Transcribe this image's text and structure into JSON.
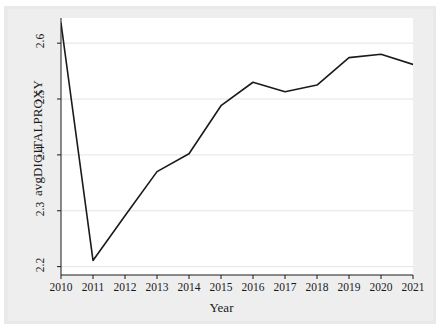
{
  "chart_data": {
    "type": "line",
    "title": "",
    "xlabel": "Year",
    "ylabel": "avgDIGITALPROXY",
    "x": [
      2010,
      2011,
      2012,
      2013,
      2014,
      2015,
      2016,
      2017,
      2018,
      2019,
      2020,
      2021
    ],
    "categories": [
      "2010",
      "2011",
      "2012",
      "2013",
      "2014",
      "2015",
      "2016",
      "2017",
      "2018",
      "2019",
      "2020",
      "2021"
    ],
    "values": [
      2.636,
      2.211,
      2.291,
      2.37,
      2.402,
      2.488,
      2.53,
      2.513,
      2.525,
      2.574,
      2.58,
      2.562
    ],
    "series": [
      {
        "name": "avgDIGITALPROXY",
        "values": [
          2.636,
          2.211,
          2.291,
          2.37,
          2.402,
          2.488,
          2.53,
          2.513,
          2.525,
          2.574,
          2.58,
          2.562
        ]
      }
    ],
    "xlim": [
      2010,
      2021
    ],
    "ylim": [
      2.185,
      2.645
    ],
    "ytick_labels": [
      "2.2",
      "2.3",
      "2.4",
      "2.5",
      "2.6"
    ],
    "ytick_values": [
      2.2,
      2.3,
      2.4,
      2.5,
      2.6
    ],
    "xtick_labels": [
      "2010",
      "2011",
      "2012",
      "2013",
      "2014",
      "2015",
      "2016",
      "2017",
      "2018",
      "2019",
      "2020",
      "2021"
    ],
    "grid": "horizontal",
    "legend": "none",
    "line_color": "#1a1a1a",
    "plot_background": "#ffffff",
    "figure_background": "#e9e9e9",
    "grid_color": "#e4e4e4"
  }
}
